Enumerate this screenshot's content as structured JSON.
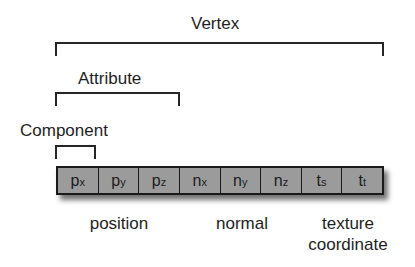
{
  "levels": {
    "vertex": "Vertex",
    "attribute": "Attribute",
    "component": "Component"
  },
  "cells": [
    {
      "base": "p",
      "sub": "x"
    },
    {
      "base": "p",
      "sub": "y"
    },
    {
      "base": "p",
      "sub": "z"
    },
    {
      "base": "n",
      "sub": "x"
    },
    {
      "base": "n",
      "sub": "y"
    },
    {
      "base": "n",
      "sub": "z"
    },
    {
      "base": "t",
      "sub": "s"
    },
    {
      "base": "t",
      "sub": "t"
    }
  ],
  "groups": {
    "position": "position",
    "normal": "normal",
    "texture_line1": "texture",
    "texture_line2": "coordinate"
  },
  "colors": {
    "cell_fill": "#9b9b9b",
    "stroke": "#1a1a1a"
  }
}
